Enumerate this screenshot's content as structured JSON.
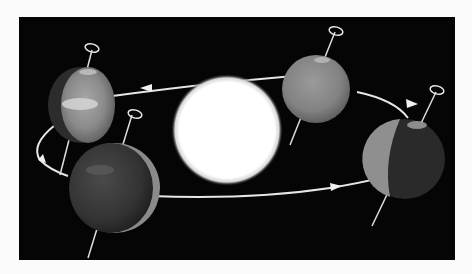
{
  "figure": {
    "background_color": "#050505",
    "page_color": "#fbfbfb",
    "sun": {
      "label": "",
      "color": "#ffffff"
    },
    "earths": [
      {
        "position": "left",
        "note": "tilted axis, sunlit face toward sun"
      },
      {
        "position": "front-left",
        "note": "mostly dark face toward viewer"
      },
      {
        "position": "top-right",
        "note": "fully lit face"
      },
      {
        "position": "right",
        "note": "half lit, half dark"
      }
    ],
    "orbit": {
      "color": "#e8e8e8",
      "direction_arrows": 4
    }
  }
}
